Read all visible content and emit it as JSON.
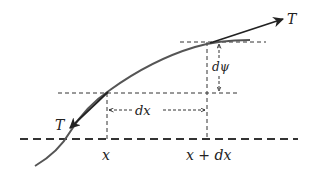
{
  "diagram": {
    "colors": {
      "curve": "#555555",
      "arrow": "#222222",
      "dash": "#333333",
      "text": "#222222",
      "background": "#ffffff"
    },
    "labels": {
      "tension_upper": "T",
      "tension_lower": "T",
      "angle_change": "dψ",
      "width": "dx",
      "x_left": "x",
      "x_right": "x + dx"
    },
    "elements": [
      {
        "id": "string-curve",
        "type": "curve"
      },
      {
        "id": "tangent-arrow-upper",
        "type": "arrow",
        "label": "T"
      },
      {
        "id": "tangent-arrow-lower",
        "type": "arrow",
        "label": "T"
      },
      {
        "id": "horizontal-ref-upper",
        "type": "dashed-line"
      },
      {
        "id": "horizontal-ref-lower",
        "type": "dashed-line"
      },
      {
        "id": "x-axis-baseline",
        "type": "dashed-line"
      },
      {
        "id": "vertical-guide-x",
        "type": "dashed-line"
      },
      {
        "id": "vertical-guide-x-dx",
        "type": "dashed-line"
      },
      {
        "id": "dx-dimension",
        "type": "double-arrow",
        "label": "dx"
      },
      {
        "id": "dpsi-dimension",
        "type": "double-arrow",
        "label": "dψ"
      }
    ]
  }
}
